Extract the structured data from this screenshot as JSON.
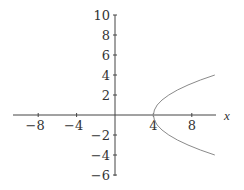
{
  "chart_data": {
    "type": "line",
    "title": "",
    "xlabel": "x",
    "ylabel": "",
    "xlim": [
      -10.6,
      10.6
    ],
    "ylim": [
      -6,
      10
    ],
    "x_ticks": [
      -8,
      -4,
      4,
      8
    ],
    "y_ticks": [
      -6,
      -4,
      -2,
      2,
      4,
      6,
      8,
      10
    ],
    "x_tick_labels": [
      "−8",
      "−4",
      "4",
      "8"
    ],
    "y_tick_labels": [
      "−6",
      "−4",
      "−2",
      "2",
      "4",
      "6",
      "8",
      "10"
    ],
    "grid": false,
    "legend": null,
    "series": [
      {
        "name": "curve",
        "description": "sideways parabola opening right, vertex at (4, 0)",
        "color": "#888888",
        "points": [
          {
            "x": 10.4,
            "y": 4
          },
          {
            "x": 8.9,
            "y": 3.5
          },
          {
            "x": 7.6,
            "y": 3
          },
          {
            "x": 6.5,
            "y": 2.5
          },
          {
            "x": 5.6,
            "y": 2
          },
          {
            "x": 4.9,
            "y": 1.5
          },
          {
            "x": 4.4,
            "y": 1
          },
          {
            "x": 4.1,
            "y": 0.5
          },
          {
            "x": 4,
            "y": 0
          },
          {
            "x": 4.1,
            "y": -0.5
          },
          {
            "x": 4.4,
            "y": -1
          },
          {
            "x": 4.9,
            "y": -1.5
          },
          {
            "x": 5.6,
            "y": -2
          },
          {
            "x": 6.5,
            "y": -2.5
          },
          {
            "x": 7.6,
            "y": -3
          },
          {
            "x": 8.9,
            "y": -3.5
          },
          {
            "x": 10.4,
            "y": -4
          }
        ]
      }
    ]
  },
  "colors": {
    "axis": "#444444",
    "curve": "#8a8a8a",
    "text": "#333333"
  }
}
